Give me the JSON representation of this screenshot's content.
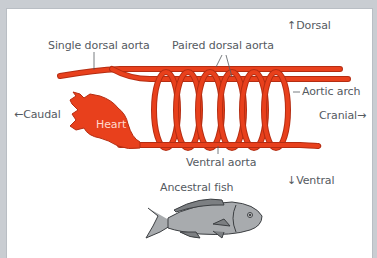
{
  "diagram": {
    "labels": {
      "single_dorsal_aorta": "Single dorsal aorta",
      "paired_dorsal_aorta": "Paired dorsal aorta",
      "dorsal": "Dorsal",
      "aortic_arch": "Aortic arch",
      "caudal": "Caudal",
      "cranial": "Cranial",
      "heart": "Heart",
      "ventral_aorta": "Ventral aorta",
      "ventral": "Ventral",
      "ancestral_fish": "Ancestral fish"
    },
    "arrows": {
      "up": "↑",
      "down": "↓",
      "left": "←",
      "right": "→"
    },
    "aortic_arch_count": 6,
    "colors": {
      "vessel": "#e8401c",
      "vessel_outline": "#b52d12",
      "fish_body": "#a8abae",
      "fish_outline": "#3c3f42",
      "label_text": "#555a5f",
      "background": "#ffffff",
      "frame": "#c9cdd2"
    }
  }
}
